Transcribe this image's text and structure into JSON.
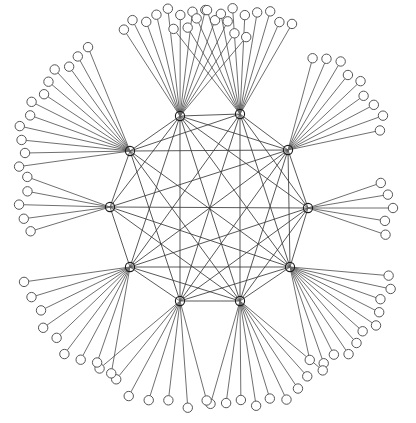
{
  "figure": {
    "type": "node-link-network-graph",
    "title": "",
    "background_color": "#ffffff",
    "width": 416,
    "height": 423
  },
  "style": {
    "core_edge_color": "#3a3a3a",
    "leaf_edge_color": "#4a4a4a",
    "hub_stroke_color": "#1a1a1a",
    "leaf_stroke_color": "#555555",
    "leaf_fill_color": "#ffffff",
    "core_edge_width": 0.85,
    "leaf_edge_width": 0.8,
    "hub_radius": 4.6,
    "leaf_radius": 4.7
  },
  "chart_data": {
    "type": "scatter",
    "title": "",
    "xlabel": "",
    "ylabel": "",
    "layout": "radial ring of hubs with leaf fans",
    "center": {
      "x": 209,
      "y": 208
    },
    "hub_ring_radius": 95,
    "node_counts": {
      "hubs": 10,
      "leaves": 85,
      "total": 95
    },
    "edge_counts": {
      "core_edges": 41,
      "leaf_edges": 85,
      "total": 126
    },
    "hubs": [
      {
        "id": "H0",
        "x": 180,
        "y": 116,
        "leaves": 12,
        "fan_start_deg": 237,
        "fan_end_deg": 310,
        "fan_radius": 104
      },
      {
        "id": "H1",
        "x": 240,
        "y": 114,
        "leaves": 11,
        "fan_start_deg": 232,
        "fan_end_deg": 300,
        "fan_radius": 104
      },
      {
        "id": "H2",
        "x": 288,
        "y": 150,
        "leaves": 9,
        "fan_start_deg": 285,
        "fan_end_deg": 348,
        "fan_radius": 98
      },
      {
        "id": "H3",
        "x": 308,
        "y": 208,
        "leaves": 5,
        "fan_start_deg": 341,
        "fan_end_deg": 19,
        "fan_radius": 82
      },
      {
        "id": "H4",
        "x": 290,
        "y": 267,
        "leaves": 11,
        "fan_start_deg": 5,
        "fan_end_deg": 78,
        "fan_radius": 100
      },
      {
        "id": "H5",
        "x": 240,
        "y": 301,
        "leaves": 9,
        "fan_start_deg": 40,
        "fan_end_deg": 106,
        "fan_radius": 104
      },
      {
        "id": "H6",
        "x": 180,
        "y": 301,
        "leaves": 7,
        "fan_start_deg": 75,
        "fan_end_deg": 140,
        "fan_radius": 104
      },
      {
        "id": "H7",
        "x": 130,
        "y": 267,
        "leaves": 9,
        "fan_start_deg": 100,
        "fan_end_deg": 172,
        "fan_radius": 104
      },
      {
        "id": "H8",
        "x": 110,
        "y": 207,
        "leaves": 5,
        "fan_start_deg": 163,
        "fan_end_deg": 200,
        "fan_radius": 88
      },
      {
        "id": "H9",
        "x": 130,
        "y": 151,
        "leaves": 12,
        "fan_start_deg": 172,
        "fan_end_deg": 248,
        "fan_radius": 108
      }
    ],
    "core_edges": [
      [
        "H0",
        "H1"
      ],
      [
        "H0",
        "H2"
      ],
      [
        "H0",
        "H3"
      ],
      [
        "H0",
        "H4"
      ],
      [
        "H0",
        "H5"
      ],
      [
        "H0",
        "H6"
      ],
      [
        "H0",
        "H7"
      ],
      [
        "H0",
        "H8"
      ],
      [
        "H0",
        "H9"
      ],
      [
        "H1",
        "H2"
      ],
      [
        "H1",
        "H3"
      ],
      [
        "H1",
        "H4"
      ],
      [
        "H1",
        "H5"
      ],
      [
        "H1",
        "H6"
      ],
      [
        "H1",
        "H7"
      ],
      [
        "H1",
        "H9"
      ],
      [
        "H2",
        "H3"
      ],
      [
        "H2",
        "H4"
      ],
      [
        "H2",
        "H5"
      ],
      [
        "H2",
        "H6"
      ],
      [
        "H2",
        "H7"
      ],
      [
        "H2",
        "H8"
      ],
      [
        "H2",
        "H9"
      ],
      [
        "H3",
        "H4"
      ],
      [
        "H3",
        "H5"
      ],
      [
        "H3",
        "H6"
      ],
      [
        "H3",
        "H7"
      ],
      [
        "H3",
        "H8"
      ],
      [
        "H4",
        "H5"
      ],
      [
        "H4",
        "H6"
      ],
      [
        "H4",
        "H7"
      ],
      [
        "H4",
        "H8"
      ],
      [
        "H4",
        "H9"
      ],
      [
        "H5",
        "H6"
      ],
      [
        "H5",
        "H7"
      ],
      [
        "H5",
        "H8"
      ],
      [
        "H5",
        "H9"
      ],
      [
        "H6",
        "H7"
      ],
      [
        "H6",
        "H9"
      ],
      [
        "H7",
        "H8"
      ],
      [
        "H8",
        "H9"
      ]
    ]
  }
}
